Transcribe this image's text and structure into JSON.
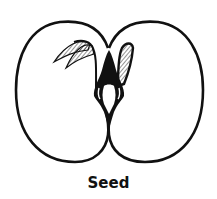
{
  "diagram": {
    "title": "Seed",
    "parts": [
      {
        "name": "left-cotyledon"
      },
      {
        "name": "right-cotyledon"
      },
      {
        "name": "plumule"
      },
      {
        "name": "radicle"
      }
    ]
  },
  "colors": {
    "ink": "#111111",
    "background": "#ffffff"
  }
}
